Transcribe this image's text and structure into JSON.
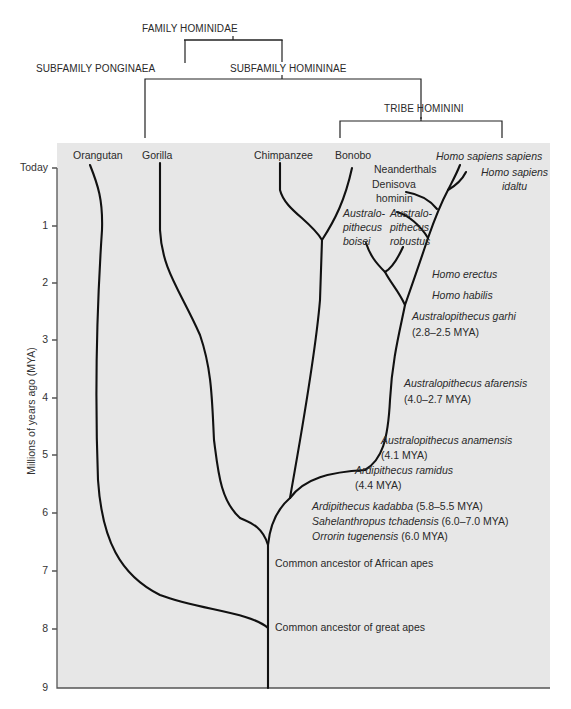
{
  "taxonomy": {
    "family": "FAMILY HOMINIDAE",
    "subfamily_left": "SUBFAMILY PONGINAEA",
    "subfamily_right": "SUBFAMILY HOMININAE",
    "tribe": "TRIBE HOMININI"
  },
  "axis": {
    "title": "Millions of years ago (MYA)",
    "ticks": [
      "Today",
      "1",
      "2",
      "3",
      "4",
      "5",
      "6",
      "7",
      "8",
      "9"
    ]
  },
  "species": {
    "orangutan": "Orangutan",
    "gorilla": "Gorilla",
    "chimpanzee": "Chimpanzee",
    "bonobo": "Bonobo",
    "homo_sapiens_sapiens": "Homo sapiens sapiens",
    "homo_sapiens_idaltu_1": "Homo sapiens",
    "homo_sapiens_idaltu_2": "idaltu",
    "neanderthals": "Neanderthals",
    "denisova_1": "Denisova",
    "denisova_2": "hominin",
    "boisei_1": "Australo-",
    "boisei_2": "pithecus",
    "boisei_3": "boisei",
    "robustus_1": "Australo-",
    "robustus_2": "pithecus",
    "robustus_3": "robustus",
    "homo_erectus": "Homo erectus",
    "homo_habilis": "Homo habilis",
    "garhi_name": "Australopithecus garhi",
    "garhi_date": "(2.8–2.5 MYA)",
    "afarensis_name": "Australopithecus afarensis",
    "afarensis_date": "(4.0–2.7 MYA)",
    "anamensis_name": "Australopithecus anamensis",
    "anamensis_date": "(4.1 MYA)",
    "ramidus_name": "Ardipithecus ramidus",
    "ramidus_date": "(4.4 MYA)",
    "kadabba_name": "Ardipithecus kadabba",
    "kadabba_date": "(5.8–5.5 MYA)",
    "sahelanthropus_name": "Sahelanthropus tchadensis",
    "sahelanthropus_date": "(6.0–7.0 MYA)",
    "orrorin_name": "Orrorin tugenensis",
    "orrorin_date": "(6.0 MYA)"
  },
  "nodes": {
    "african_apes": "Common ancestor of African apes",
    "great_apes": "Common ancestor of great apes"
  },
  "colors": {
    "plot_background": "#e7e7e7",
    "branch": "#111111",
    "axis": "#555555"
  }
}
